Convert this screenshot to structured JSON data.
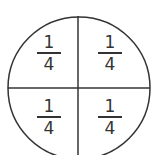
{
  "diagram": {
    "shape": "circle",
    "divisions": 4,
    "stroke_color": "#333333",
    "fractions": [
      {
        "quadrant": "top-left",
        "numerator": "1",
        "denominator": "4"
      },
      {
        "quadrant": "top-right",
        "numerator": "1",
        "denominator": "4"
      },
      {
        "quadrant": "bottom-left",
        "numerator": "1",
        "denominator": "4"
      },
      {
        "quadrant": "bottom-right",
        "numerator": "1",
        "denominator": "4"
      }
    ]
  }
}
